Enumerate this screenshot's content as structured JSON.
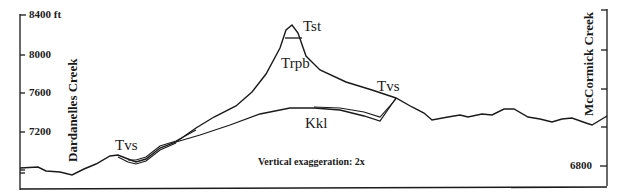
{
  "figure": {
    "left_axis": {
      "ticks": [
        {
          "label": "8400 ft",
          "value": 8400
        },
        {
          "label": "8000",
          "value": 8000
        },
        {
          "label": "7600",
          "value": 7600
        },
        {
          "label": "7200",
          "value": 7200
        }
      ]
    },
    "right_axis": {
      "ticks": [
        {
          "label": "6800",
          "value": 6800
        }
      ]
    },
    "place_labels": {
      "left": "Dardanelles Creek",
      "right": "McCormick Creek"
    },
    "units": {
      "tst": "Tst",
      "trpb": "Trpb",
      "tvs_right": "Tvs",
      "tvs_left": "Tvs",
      "kkl": "Kkl"
    },
    "note": "Vertical exaggeration: 2x",
    "line_color": "#1a1a1a"
  }
}
